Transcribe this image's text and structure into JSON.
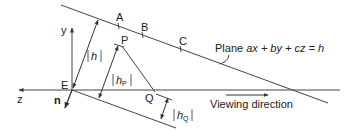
{
  "diagram": {
    "points": {
      "A": "A",
      "B": "B",
      "C": "C",
      "P": "P",
      "Q": "Q",
      "E": "E"
    },
    "axes": {
      "y": "y",
      "z": "z"
    },
    "normal_label": "n",
    "distances": {
      "h": "h",
      "hP_base": "h",
      "hP_sub": "P",
      "hQ_base": "h",
      "hQ_sub": "Q"
    },
    "plane_label_prefix": "Plane ",
    "plane_equation": "ax + by + cz = h",
    "viewing_direction_label": "Viewing direction",
    "line_color": "#333333"
  }
}
